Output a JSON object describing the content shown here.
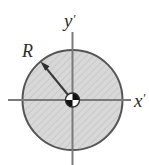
{
  "figure": {
    "kind": "engineering-cross-section-diagram",
    "background_color": "#ffffff",
    "width": 149,
    "height": 165,
    "labels": {
      "y_axis": "y",
      "y_axis_prime": "′",
      "x_axis": "x",
      "x_axis_prime": "′",
      "radius": "R"
    },
    "axes": {
      "horizontal": {
        "name": "x-prime-axis",
        "x1": 8,
        "y1": 100,
        "x2": 131,
        "y2": 100,
        "color": "#7a7a7a",
        "stroke_width": 2
      },
      "vertical": {
        "name": "y-prime-axis",
        "x1": 72.5,
        "y1": 32,
        "x2": 72.5,
        "y2": 165,
        "color": "#7a7a7a",
        "stroke_width": 2
      },
      "origin": {
        "x": 72.5,
        "y": 100
      }
    },
    "shape": {
      "name": "shaded-circle",
      "type": "circle",
      "center_x": 72.5,
      "center_y": 100,
      "radius": 50,
      "fill_color": "#d6d6d6",
      "outline_color": "#555555",
      "outline_width": 2,
      "hatch_color": "#c2c2c2"
    },
    "radius_arrow": {
      "name": "radius-dimension-arrow",
      "from_x": 72.5,
      "from_y": 100,
      "to_x": 41.5,
      "to_y": 62.5,
      "color": "#3a3a3a",
      "stroke_width": 2
    },
    "centroid_marker": {
      "name": "centroid-pinwheel-marker",
      "center_x": 72.5,
      "center_y": 100,
      "radius": 7,
      "dark_color": "#101010",
      "light_color": "#fbfbfb",
      "outline_color": "#2a2a2a",
      "dark_quadrants": [
        "top-right",
        "bottom-left"
      ],
      "light_quadrants": [
        "top-left",
        "bottom-right"
      ]
    },
    "label_positions": {
      "y_label": {
        "x": 64,
        "y": 27
      },
      "x_label": {
        "x": 134,
        "y": 107
      },
      "r_label": {
        "x": 22,
        "y": 57
      }
    }
  }
}
